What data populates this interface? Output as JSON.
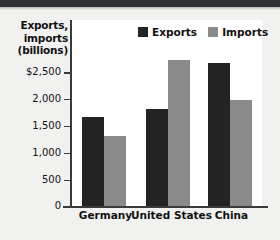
{
  "chart_data": {
    "type": "bar",
    "title": "",
    "xlabel": "",
    "ylabel": "Exports, imports (billions)",
    "ylabel_lines": [
      "Exports,",
      "imports",
      "(billions)"
    ],
    "categories": [
      "Germany",
      "United States",
      "China"
    ],
    "series": [
      {
        "name": "Exports",
        "color": "#232323",
        "values": [
          1320,
          1440,
          2120
        ]
      },
      {
        "name": "Imports",
        "color": "#8a8a8a",
        "values": [
          1040,
          2170,
          1570
        ]
      }
    ],
    "ylim": [
      0,
      2750
    ],
    "yticks": [
      0,
      500,
      1000,
      1500,
      2000,
      2500
    ],
    "ytick_labels": [
      "0",
      "500",
      "1,000",
      "1,500",
      "2,000",
      "$2,500"
    ],
    "grid": false,
    "legend_position": "top-right"
  },
  "legend": {
    "items": [
      {
        "label": "Exports",
        "color": "#232323"
      },
      {
        "label": "Imports",
        "color": "#8a8a8a"
      }
    ]
  },
  "colors": {
    "exports": "#232323",
    "imports": "#8a8a8a",
    "background": "#f1f1f0",
    "panel": "#ffffff",
    "axis": "#3a3a3a",
    "top_band": "#2f3033"
  }
}
